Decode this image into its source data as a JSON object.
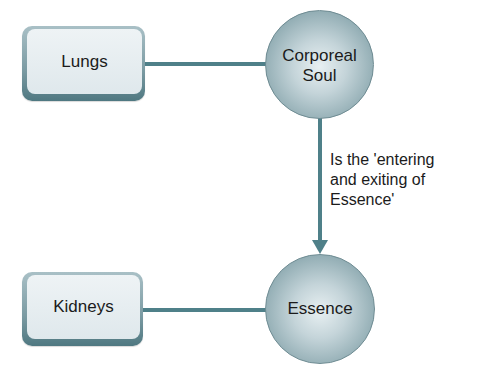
{
  "diagram": {
    "colors": {
      "connector": "#4f8089",
      "box_border": "#5f8790",
      "box_fill": "#e6eef1",
      "circle_fill": "#b4c8ce",
      "text": "#1b1b1b"
    },
    "nodes": {
      "lungs": {
        "label": "Lungs",
        "shape": "rounded-rectangle"
      },
      "corporeal_soul": {
        "label": "Corporeal\nSoul",
        "shape": "circle"
      },
      "kidneys": {
        "label": "Kidneys",
        "shape": "rounded-rectangle"
      },
      "essence": {
        "label": "Essence",
        "shape": "circle"
      }
    },
    "edges": [
      {
        "from": "lungs",
        "to": "corporeal_soul",
        "type": "line"
      },
      {
        "from": "corporeal_soul",
        "to": "essence",
        "type": "arrow",
        "label": "Is the 'entering\nand exiting of\nEssence'"
      },
      {
        "from": "kidneys",
        "to": "essence",
        "type": "line"
      }
    ],
    "edge_label_soul_to_essence": "Is the 'entering\nand exiting of\nEssence'"
  }
}
